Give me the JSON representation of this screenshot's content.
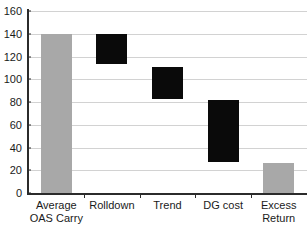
{
  "chart_data": {
    "type": "bar",
    "subtype": "waterfall",
    "title": "",
    "xlabel": "",
    "ylabel": "",
    "ylim": [
      0,
      160
    ],
    "ytick_step": 20,
    "yticks": [
      160,
      140,
      120,
      100,
      80,
      60,
      40,
      20,
      0
    ],
    "ytick_labels": [
      "160",
      "140",
      "120",
      "100",
      "80",
      "60",
      "40",
      "20",
      "0"
    ],
    "grid": true,
    "grid_axis": "y",
    "legend": false,
    "categories": [
      "Average OAS Carry",
      "Rolldown",
      "Trend",
      "DG cost",
      "Excess Return"
    ],
    "category_label_lines": [
      [
        "Average",
        "OAS Carry"
      ],
      [
        "Rolldown"
      ],
      [
        "Trend"
      ],
      [
        "DG cost"
      ],
      [
        "Excess",
        "Return"
      ]
    ],
    "bars": [
      {
        "category": "Average OAS Carry",
        "base": 0,
        "top": 140,
        "value": 140,
        "delta": 140,
        "kind": "total",
        "color": "#a8a8a8"
      },
      {
        "category": "Rolldown",
        "base": 113,
        "top": 140,
        "value": 27,
        "delta": -27,
        "kind": "decrease",
        "color": "#0a0a0a"
      },
      {
        "category": "Trend",
        "base": 83,
        "top": 111,
        "value": 28,
        "delta": -28,
        "kind": "decrease",
        "color": "#0a0a0a"
      },
      {
        "category": "DG cost",
        "base": 27,
        "top": 82,
        "value": 55,
        "delta": -55,
        "kind": "decrease",
        "color": "#0a0a0a"
      },
      {
        "category": "Excess Return",
        "base": 0,
        "top": 26,
        "value": 26,
        "delta": 26,
        "kind": "total",
        "color": "#a8a8a8"
      }
    ],
    "colors": {
      "total_bar": "#a8a8a8",
      "step_bar": "#0a0a0a",
      "gridline": "#d2d2d2",
      "axis": "#2b2b2b",
      "background": "#ffffff",
      "text": "#1a1a1a"
    }
  }
}
